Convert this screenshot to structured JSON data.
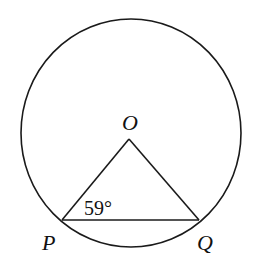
{
  "diagram": {
    "type": "circle-geometry",
    "circle": {
      "center_label": "O",
      "cx": 131,
      "cy": 133,
      "rx": 110,
      "ry": 114
    },
    "points": {
      "O": {
        "label": "O",
        "x": 129,
        "y": 139,
        "label_x": 130,
        "label_y": 130
      },
      "P": {
        "label": "P",
        "x": 62,
        "y": 220,
        "label_x": 50,
        "label_y": 248
      },
      "Q": {
        "label": "Q",
        "x": 199,
        "y": 220,
        "label_x": 205,
        "label_y": 248
      }
    },
    "segments": [
      "OP",
      "OQ",
      "PQ"
    ],
    "angle": {
      "vertex": "P",
      "label": "59°",
      "x": 84,
      "y": 212
    },
    "stroke_color": "#1a1a1a"
  }
}
